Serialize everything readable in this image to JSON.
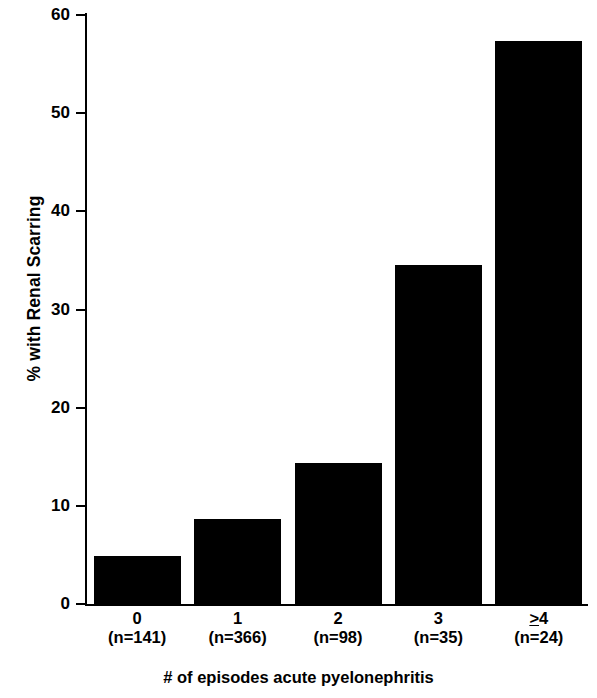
{
  "chart_data": {
    "type": "bar",
    "title": "",
    "subtitle": "",
    "xlabel": "# of episodes acute pyelonephritis",
    "ylabel": "% with Renal Scarring",
    "categories": [
      "0",
      "1",
      "2",
      "3",
      "≥4"
    ],
    "group_sizes": [
      "(n=141)",
      "(n=366)",
      "(n=98)",
      "(n=35)",
      "(n=24)"
    ],
    "values": [
      5.0,
      8.8,
      14.5,
      34.6,
      57.5
    ],
    "ylim": [
      0,
      60
    ],
    "yticks": [
      0,
      10,
      20,
      30,
      40,
      50,
      60
    ],
    "ytick_labels": [
      "0",
      "10",
      "20",
      "30",
      "40",
      "50",
      "60"
    ],
    "grid": false,
    "legend": false,
    "legend_position": "none",
    "bar_color": "#000000",
    "axis_color": "#000000",
    "background_color": "#ffffff"
  }
}
